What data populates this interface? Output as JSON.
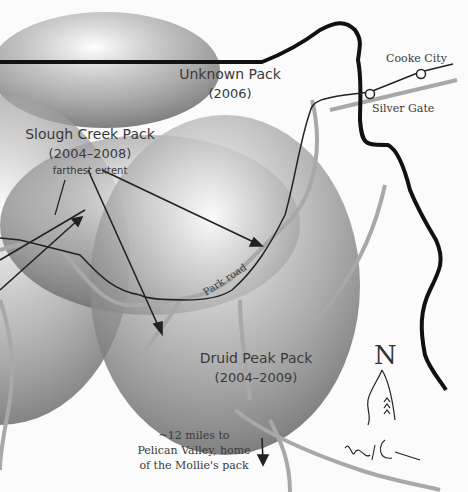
{
  "map": {
    "packs": [
      {
        "name": "Unknown Pack",
        "years": "(2006)"
      },
      {
        "name": "Slough Creek Pack",
        "years": "(2004–2008)",
        "annotation": "farthest extent"
      },
      {
        "name": "Druid Peak Pack",
        "years": "(2004–2009)"
      }
    ],
    "towns": [
      {
        "name": "Cooke City"
      },
      {
        "name": "Silver Gate"
      }
    ],
    "road_label": "Park road",
    "note": {
      "line1": "~12 miles to",
      "line2": "Pelican Valley, home",
      "line3": "of the Mollie's pack"
    },
    "compass": {
      "letter": "N",
      "icon": "wolf-head-icon"
    },
    "signature": "Ken A Ceci",
    "colors": {
      "background": "#fbfbfb",
      "territory": "#7a7a7a",
      "river": "#a8a8a8",
      "boundary": "#111111",
      "road": "#222222",
      "text": "#3a3a3a"
    }
  }
}
